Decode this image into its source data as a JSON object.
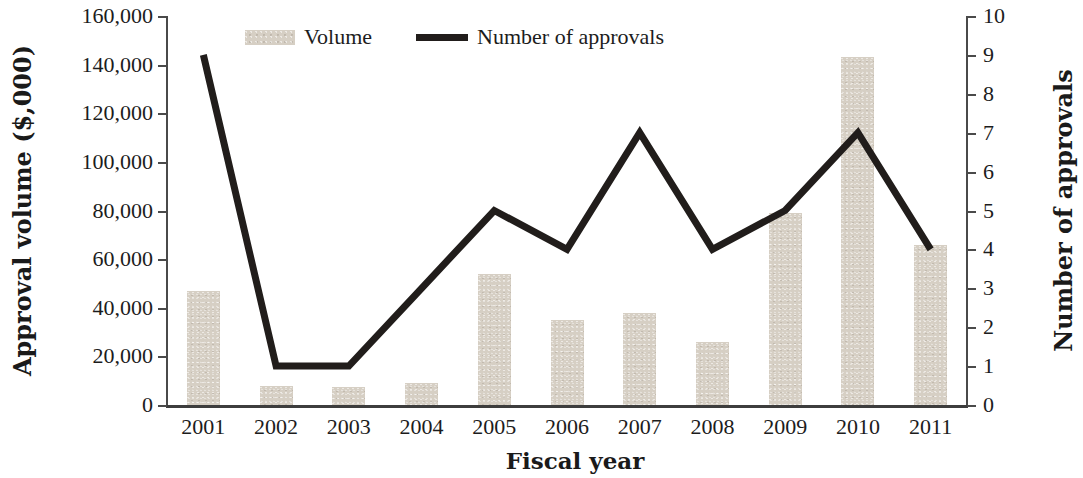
{
  "chart_data": {
    "type": "bar",
    "title": "",
    "xlabel": "Fiscal year",
    "ylabel": "Approval volume ($,000)",
    "y2label": "Number of approvals",
    "categories": [
      "2001",
      "2002",
      "2003",
      "2004",
      "2005",
      "2006",
      "2007",
      "2008",
      "2009",
      "2010",
      "2011"
    ],
    "series": [
      {
        "name": "Volume",
        "type": "bar",
        "axis": "left",
        "color": "#d6cfc4",
        "values": [
          47000,
          8000,
          7500,
          9000,
          54000,
          35000,
          38000,
          26000,
          79000,
          143000,
          66000
        ]
      },
      {
        "name": "Number of approvals",
        "type": "line",
        "axis": "right",
        "color": "#211d1b",
        "values": [
          9,
          1,
          1,
          3,
          5,
          4,
          7,
          4,
          5,
          7,
          4
        ]
      }
    ],
    "ylim": [
      0,
      160000
    ],
    "y2lim": [
      0,
      10
    ],
    "yticks": [
      0,
      20000,
      40000,
      60000,
      80000,
      100000,
      120000,
      140000,
      160000
    ],
    "ytick_labels": [
      "0",
      "20,000",
      "40,000",
      "60,000",
      "80,000",
      "100,000",
      "120,000",
      "140,000",
      "160,000"
    ],
    "y2ticks": [
      0,
      1,
      2,
      3,
      4,
      5,
      6,
      7,
      8,
      9,
      10
    ],
    "y2tick_labels": [
      "0",
      "1",
      "2",
      "3",
      "4",
      "5",
      "6",
      "7",
      "8",
      "9",
      "10"
    ],
    "grid": false,
    "legend_position": "top-center",
    "legend": [
      {
        "label": "Volume",
        "marker": "bar-swatch"
      },
      {
        "label": "Number of approvals",
        "marker": "line-swatch"
      }
    ]
  }
}
